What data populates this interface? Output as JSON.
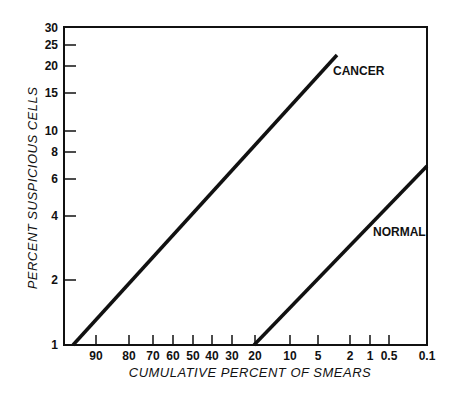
{
  "chart_data": {
    "type": "line",
    "title": "",
    "xlabel": "CUMULATIVE PERCENT OF SMEARS",
    "ylabel": "PERCENT SUSPICIOUS CELLS",
    "x_scale": "probability (normal-probability axis, decreasing left to right)",
    "y_scale": "log",
    "ylim": [
      1,
      30
    ],
    "xlim": [
      97,
      0.1
    ],
    "x_ticks": [
      "90",
      "80",
      "70",
      "60",
      "50",
      "40",
      "30",
      "20",
      "10",
      "5",
      "2",
      "1",
      "0.5",
      "0.1"
    ],
    "y_ticks": [
      "1",
      "2",
      "4",
      "6",
      "8",
      "10",
      "15",
      "20",
      "25",
      "30"
    ],
    "grid": false,
    "series": [
      {
        "name": "CANCER",
        "points": [
          {
            "x": 97,
            "y": 1
          },
          {
            "x": 3,
            "y": 22.5
          }
        ]
      },
      {
        "name": "NORMAL",
        "points": [
          {
            "x": 20,
            "y": 1
          },
          {
            "x": 0.1,
            "y": 6.8
          }
        ]
      }
    ]
  },
  "render": {
    "frame": {
      "left": 64,
      "top": 27,
      "right": 427,
      "bottom": 345
    },
    "x_tick_px": [
      {
        "label": "90",
        "x": 96
      },
      {
        "label": "80",
        "x": 129
      },
      {
        "label": "70",
        "x": 153
      },
      {
        "label": "60",
        "x": 173
      },
      {
        "label": "50",
        "x": 193
      },
      {
        "label": "40",
        "x": 212
      },
      {
        "label": "30",
        "x": 232
      },
      {
        "label": "20",
        "x": 255
      },
      {
        "label": "10",
        "x": 290
      },
      {
        "label": "5",
        "x": 318
      },
      {
        "label": "2",
        "x": 350
      },
      {
        "label": "1",
        "x": 370
      },
      {
        "label": "0.5",
        "x": 389
      },
      {
        "label": "0.1",
        "x": 427
      }
    ],
    "y_tick_px": [
      {
        "label": "30",
        "y": 28
      },
      {
        "label": "25",
        "y": 45
      },
      {
        "label": "20",
        "y": 66
      },
      {
        "label": "15",
        "y": 93
      },
      {
        "label": "10",
        "y": 131
      },
      {
        "label": "8",
        "y": 152
      },
      {
        "label": "6",
        "y": 179
      },
      {
        "label": "4",
        "y": 216
      },
      {
        "label": "2",
        "y": 280
      },
      {
        "label": "1",
        "y": 345
      }
    ],
    "lines": [
      {
        "name": "CANCER",
        "x1": 73,
        "y1": 345,
        "x2": 337,
        "y2": 55,
        "label_x": 333,
        "label_y": 75
      },
      {
        "name": "NORMAL",
        "x1": 254,
        "y1": 345,
        "x2": 427,
        "y2": 166,
        "label_x": 373,
        "label_y": 236
      }
    ],
    "line_color": "#111111"
  }
}
